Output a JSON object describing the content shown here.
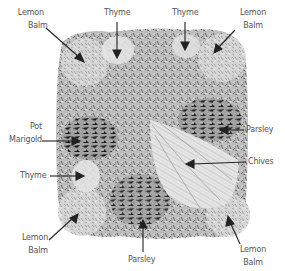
{
  "diagram": {
    "type": "herb-garden-planting-plan",
    "labels": [
      {
        "id": "lemon-balm-top-left",
        "lines": [
          "Lemon",
          "Balm"
        ]
      },
      {
        "id": "thyme-top-center",
        "lines": [
          "Thyme"
        ]
      },
      {
        "id": "thyme-top-right",
        "lines": [
          "Thyme"
        ]
      },
      {
        "id": "lemon-balm-top-right",
        "lines": [
          "Lemon",
          "Balm"
        ]
      },
      {
        "id": "pot-marigold-left",
        "lines": [
          "Pot",
          "Marigold"
        ]
      },
      {
        "id": "parsley-right",
        "lines": [
          "Parsley"
        ]
      },
      {
        "id": "chives-right",
        "lines": [
          "Chives"
        ]
      },
      {
        "id": "thyme-left",
        "lines": [
          "Thyme"
        ]
      },
      {
        "id": "lemon-balm-bottom-left",
        "lines": [
          "Lemon",
          "Balm"
        ]
      },
      {
        "id": "parsley-bottom",
        "lines": [
          "Parsley"
        ]
      },
      {
        "id": "lemon-balm-bottom-right",
        "lines": [
          "Lemon",
          "Balm"
        ]
      }
    ],
    "colors": {
      "background": "#ffffff",
      "foliage_dark": "#6e6e6e",
      "foliage_mid": "#a8a8a8",
      "foliage_light": "#dcdcdc",
      "arrow": "#222222",
      "label_text": "#555555"
    }
  }
}
